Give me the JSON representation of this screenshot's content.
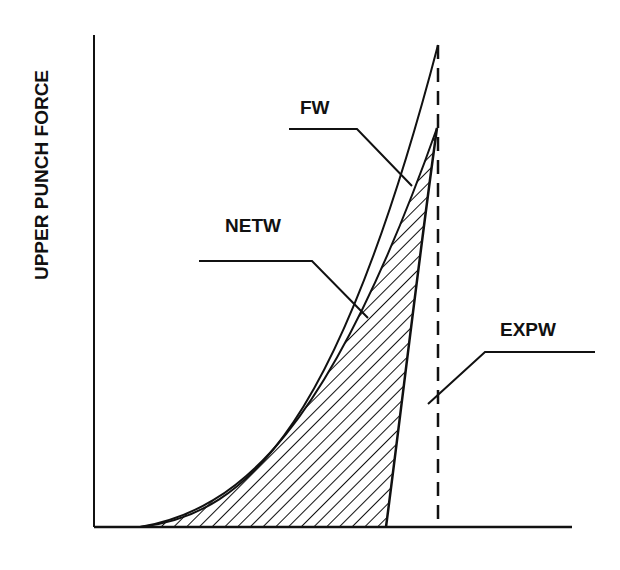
{
  "diagram": {
    "y_axis_label": "UPPER PUNCH FORCE",
    "x_axis_label": "",
    "labels": {
      "fw": "FW",
      "netw": "NETW",
      "expw": "EXPW"
    },
    "colors": {
      "ink": "#111111",
      "background": "#ffffff"
    }
  }
}
